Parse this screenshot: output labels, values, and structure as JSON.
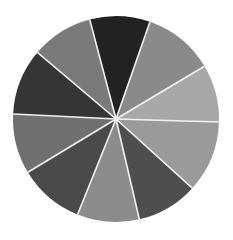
{
  "figure": {
    "type": "segmented-circle",
    "background": "#ffffff",
    "center": [
      116,
      119
    ],
    "radius": 103,
    "gap_color": "#f2f2f2",
    "gap_width": 1.6,
    "wedges": [
      {
        "end": [
          88,
          13
        ],
        "next": [
          152,
          16
        ],
        "shade": "#222222"
      },
      {
        "end": [
          152,
          16
        ],
        "next": [
          210,
          63
        ],
        "shade": "#8a8a8a"
      },
      {
        "end": [
          210,
          63
        ],
        "next": [
          219,
          122
        ],
        "shade": "#a8a8a8"
      },
      {
        "end": [
          219,
          122
        ],
        "next": [
          191,
          187
        ],
        "shade": "#9a9a9a"
      },
      {
        "end": [
          191,
          187
        ],
        "next": [
          140,
          222
        ],
        "shade": "#4e4e4e"
      },
      {
        "end": [
          140,
          222
        ],
        "next": [
          77,
          216
        ],
        "shade": "#8c8c8c"
      },
      {
        "end": [
          77,
          216
        ],
        "next": [
          30,
          171
        ],
        "shade": "#4a4a4a"
      },
      {
        "end": [
          30,
          171
        ],
        "next": [
          14,
          114
        ],
        "shade": "#707070"
      },
      {
        "end": [
          14,
          114
        ],
        "next": [
          38,
          53
        ],
        "shade": "#353535"
      },
      {
        "end": [
          38,
          53
        ],
        "next": [
          88,
          13
        ],
        "shade": "#7a7a7a"
      }
    ]
  }
}
